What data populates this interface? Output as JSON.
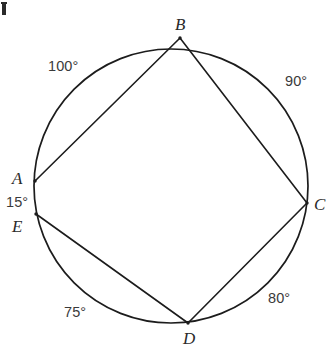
{
  "figure": {
    "background_color": "#ffffff",
    "stroke_color": "#1c1c1c",
    "label_color": "#2a2a2a",
    "width": 332,
    "height": 354,
    "circle": {
      "cx": 171,
      "cy": 186,
      "r": 137
    },
    "vertices": [
      {
        "id": "A",
        "label": "A",
        "x": 35,
        "y": 181,
        "label_x": 12,
        "label_y": 170
      },
      {
        "id": "B",
        "label": "B",
        "x": 180,
        "y": 38,
        "label_x": 175,
        "label_y": 16
      },
      {
        "id": "C",
        "label": "C",
        "x": 307,
        "y": 203,
        "label_x": 314,
        "label_y": 196
      },
      {
        "id": "D",
        "label": "D",
        "x": 188,
        "y": 323,
        "label_x": 183,
        "label_y": 330
      },
      {
        "id": "E",
        "label": "E",
        "x": 36,
        "y": 214,
        "label_x": 12,
        "label_y": 218
      }
    ],
    "chords": [
      {
        "id": "AB",
        "from": "A",
        "to": "B"
      },
      {
        "id": "BC",
        "from": "B",
        "to": "C"
      },
      {
        "id": "CD",
        "from": "C",
        "to": "D"
      },
      {
        "id": "DE",
        "from": "D",
        "to": "E"
      }
    ],
    "arc_labels": [
      {
        "id": "arc-AB",
        "text": "100°",
        "arc": "AB",
        "x": 48,
        "y": 59
      },
      {
        "id": "arc-BC",
        "text": "90°",
        "arc": "BC",
        "x": 285,
        "y": 74
      },
      {
        "id": "arc-CD",
        "text": "80°",
        "arc": "CD",
        "x": 268,
        "y": 291
      },
      {
        "id": "arc-DE",
        "text": "75°",
        "arc": "DE",
        "x": 64,
        "y": 305
      },
      {
        "id": "arc-EA",
        "text": "15°",
        "arc": "EA",
        "x": 6,
        "y": 195
      }
    ]
  }
}
